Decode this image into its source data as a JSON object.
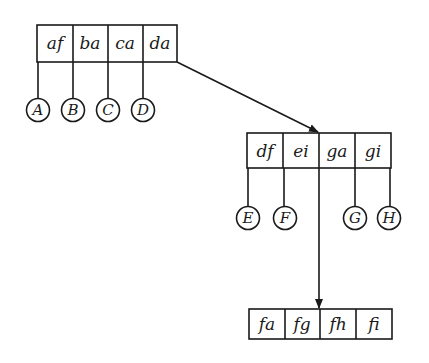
{
  "diagram": {
    "type": "b-tree",
    "nodes": {
      "root": {
        "keys": [
          "af",
          "ba",
          "ca",
          "da"
        ],
        "children": [
          "A",
          "B",
          "C",
          "D"
        ]
      },
      "middle": {
        "keys": [
          "df",
          "ei",
          "ga",
          "gi"
        ],
        "children": [
          "E",
          "F",
          "G",
          "H"
        ]
      },
      "bottom": {
        "keys": [
          "fa",
          "fg",
          "fh",
          "fi"
        ]
      }
    },
    "edges": [
      {
        "from": "root.da",
        "to": "middle",
        "arrow": true
      },
      {
        "from": "middle.ga",
        "to": "bottom",
        "arrow": true
      }
    ]
  }
}
